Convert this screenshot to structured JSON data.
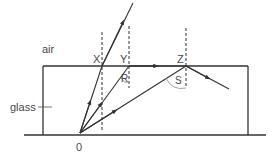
{
  "diagram": {
    "labels": {
      "medium_top": "air",
      "medium_bottom": "glass",
      "origin": "0",
      "point_x": "X",
      "point_y": "Y",
      "point_z": "Z",
      "angle_r": "R",
      "angle_s": "S"
    },
    "colors": {
      "line": "#333333",
      "text": "#4a4a4a",
      "angle_arc": "#888888",
      "background": "#ffffff"
    },
    "rays": [
      {
        "name": "ray-refracted-at-x",
        "from": "0",
        "via": "X",
        "behavior": "refracts out into air"
      },
      {
        "name": "ray-critical-at-y",
        "from": "0",
        "via": "Y",
        "behavior": "travels along surface to Z"
      },
      {
        "name": "ray-reflected-at-z",
        "from": "0",
        "via": "Z",
        "behavior": "totally internally reflected"
      }
    ]
  }
}
